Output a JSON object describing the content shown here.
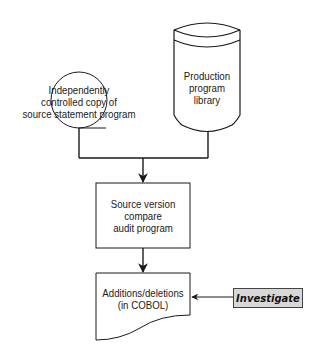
{
  "diagram": {
    "type": "flowchart",
    "nodes": [
      {
        "id": "source-copy",
        "shape": "circle",
        "lines": [
          "Independently",
          "controlled copy of",
          "source statement program"
        ]
      },
      {
        "id": "production-library",
        "shape": "disk-storage",
        "lines": [
          "Production",
          "program",
          "library"
        ]
      },
      {
        "id": "compare-program",
        "shape": "process-box",
        "lines": [
          "Source version",
          "compare",
          "audit program"
        ]
      },
      {
        "id": "additions-deletions",
        "shape": "document",
        "lines": [
          "Additions/deletions",
          "(in COBOL)"
        ]
      },
      {
        "id": "investigate",
        "shape": "shaded-box",
        "label": "Investigate"
      }
    ],
    "edges": [
      {
        "from": "source-copy",
        "to": "compare-program"
      },
      {
        "from": "production-library",
        "to": "compare-program"
      },
      {
        "from": "compare-program",
        "to": "additions-deletions"
      },
      {
        "from": "investigate",
        "to": "additions-deletions"
      }
    ],
    "colors": {
      "line": "#1a1a1a",
      "shade": "#d8d8d8",
      "background": "#ffffff"
    }
  }
}
